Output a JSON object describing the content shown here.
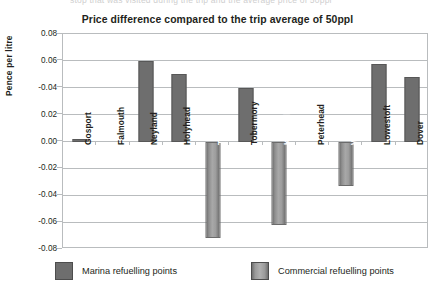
{
  "ghost_text": "stop that was visited during the trip and the average price of 50ppl",
  "chart_data": {
    "type": "bar",
    "title": "Price difference compared to the trip average of 50ppl",
    "xlabel": "",
    "ylabel": "Pence per litre",
    "ylim": [
      -0.08,
      0.08
    ],
    "grid": true,
    "legend_position": "bottom",
    "ytick_labels": [
      "0.08",
      "0.06",
      "-0.04",
      "0.02",
      "0.00",
      "-0.02",
      "-0.04",
      "-0.06",
      "-0.08"
    ],
    "ytick_values": [
      0.08,
      0.06,
      0.04,
      0.02,
      0.0,
      -0.02,
      -0.04,
      -0.06,
      -0.08
    ],
    "categories": [
      "Gosport",
      "Falmouth",
      "Neyland",
      "Holyhead",
      "Tarbert",
      "Tobermory",
      "Kirkwall",
      "Peterhead",
      "Whitby",
      "Lowestoft",
      "Dover"
    ],
    "series": [
      {
        "name": "Marina refuelling points",
        "color": "#6e6e6e",
        "values": [
          0.002,
          0,
          0.06,
          0.05,
          null,
          0.04,
          null,
          0,
          null,
          0.058,
          0.048
        ]
      },
      {
        "name": "Commercial refuelling points",
        "color": "#a8a8a8",
        "values": [
          null,
          null,
          null,
          null,
          -0.072,
          null,
          -0.062,
          null,
          -0.033,
          null,
          null
        ]
      }
    ],
    "bars": [
      {
        "category": "Gosport",
        "series": "Marina refuelling points",
        "value": 0.002
      },
      {
        "category": "Falmouth",
        "series": "Marina refuelling points",
        "value": 0
      },
      {
        "category": "Neyland",
        "series": "Marina refuelling points",
        "value": 0.06
      },
      {
        "category": "Holyhead",
        "series": "Marina refuelling points",
        "value": 0.05
      },
      {
        "category": "Tarbert",
        "series": "Commercial refuelling points",
        "value": -0.072
      },
      {
        "category": "Tobermory",
        "series": "Marina refuelling points",
        "value": 0.04
      },
      {
        "category": "Kirkwall",
        "series": "Commercial refuelling points",
        "value": -0.062
      },
      {
        "category": "Peterhead",
        "series": "Marina refuelling points",
        "value": 0
      },
      {
        "category": "Whitby",
        "series": "Commercial refuelling points",
        "value": -0.033
      },
      {
        "category": "Lowestoft",
        "series": "Marina refuelling points",
        "value": 0.058
      },
      {
        "category": "Dover",
        "series": "Marina refuelling points",
        "value": 0.048
      }
    ]
  },
  "legend": [
    {
      "label": "Marina refuelling points",
      "type": "marina"
    },
    {
      "label": "Commercial refuelling points",
      "type": "commercial"
    }
  ]
}
